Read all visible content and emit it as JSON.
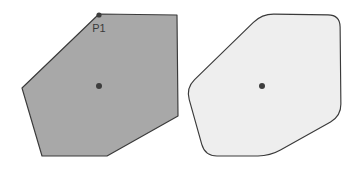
{
  "figure": {
    "background_color": "#ffffff",
    "width": 358,
    "height": 173,
    "stroke_color": "#3a3a3a",
    "marker_color": "#3d3d3d"
  },
  "shapes": {
    "left": {
      "name": "sharp-cornered-hexagon",
      "fill_color": "#a8a8a8",
      "corner_radius": 0,
      "center": {
        "x": 99,
        "y": 86
      },
      "vertices": [
        {
          "x": 99,
          "y": 14
        },
        {
          "x": 177,
          "y": 15
        },
        {
          "x": 178,
          "y": 116
        },
        {
          "x": 107,
          "y": 156
        },
        {
          "x": 42,
          "y": 156
        },
        {
          "x": 22,
          "y": 88
        }
      ]
    },
    "right": {
      "name": "rounded-corner-hexagon",
      "fill_color": "#eeeeee",
      "corner_radius": 12,
      "center": {
        "x": 262,
        "y": 86
      },
      "vertices": [
        {
          "x": 262,
          "y": 14
        },
        {
          "x": 340,
          "y": 15
        },
        {
          "x": 341,
          "y": 116
        },
        {
          "x": 270,
          "y": 156
        },
        {
          "x": 205,
          "y": 156
        },
        {
          "x": 186,
          "y": 88
        }
      ]
    }
  },
  "annotations": {
    "point_label": {
      "text": "P1",
      "x": 99,
      "y": 32,
      "marker_x": 99,
      "marker_y": 15,
      "marker_radius": 2.6
    },
    "center_marker_radius": 3.0
  }
}
